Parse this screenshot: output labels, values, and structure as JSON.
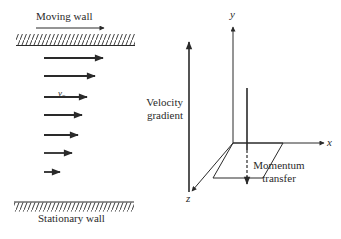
{
  "left_panel": {
    "moving_wall_label": "Moving wall",
    "stationary_wall_label": "Stationary wall",
    "velocity_label": "v",
    "velocity_subscript": "x",
    "velocity_profile_arrows": [
      {
        "y": 58,
        "x_end": 103
      },
      {
        "y": 76,
        "x_end": 95
      },
      {
        "y": 97,
        "x_end": 87
      },
      {
        "y": 115,
        "x_end": 82
      },
      {
        "y": 135,
        "x_end": 78
      },
      {
        "y": 153,
        "x_end": 72
      },
      {
        "y": 172,
        "x_end": 60
      }
    ]
  },
  "right_panel": {
    "velocity_gradient_line1": "Velocity",
    "velocity_gradient_line2": "gradient",
    "momentum_transfer_line1": "Momentum",
    "momentum_transfer_line2": "transfer",
    "axis_x": "x",
    "axis_y": "y",
    "axis_z": "z"
  },
  "colors": {
    "ink": "#2a2a2a",
    "background": "#ffffff"
  }
}
